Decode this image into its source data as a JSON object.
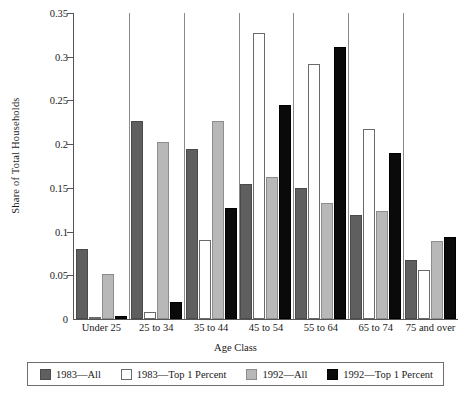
{
  "chart_data": {
    "type": "bar",
    "title": "",
    "xlabel": "Age Class",
    "ylabel": "Share of Total Households",
    "ylim": [
      0,
      0.35
    ],
    "ytick_labels": [
      "0",
      "0.05",
      "0.1",
      "0.15",
      "0.2",
      "0.25",
      "0.3",
      "0.35"
    ],
    "ytick_values": [
      0,
      0.05,
      0.1,
      0.15,
      0.2,
      0.25,
      0.3,
      0.35
    ],
    "grid": false,
    "legend_position": "bottom",
    "categories": [
      "Under 25",
      "25 to 34",
      "35 to 44",
      "45 to 54",
      "55 to 64",
      "65 to 74",
      "75 and over"
    ],
    "series": [
      {
        "name": "1983—All",
        "color": "#5f5f5f",
        "values": [
          0.08,
          0.226,
          0.195,
          0.155,
          0.15,
          0.119,
          0.068
        ]
      },
      {
        "name": "1983—Top 1 Percent",
        "color": "#ffffff",
        "values": [
          0.001,
          0.008,
          0.09,
          0.327,
          0.292,
          0.217,
          0.056
        ]
      },
      {
        "name": "1992—All",
        "color": "#b8b8b8",
        "values": [
          0.052,
          0.203,
          0.226,
          0.162,
          0.133,
          0.124,
          0.089
        ]
      },
      {
        "name": "1992—Top 1 Percent",
        "color": "#0a0a0a",
        "values": [
          0.003,
          0.02,
          0.127,
          0.245,
          0.311,
          0.19,
          0.094
        ]
      }
    ]
  },
  "legend": {
    "items": [
      {
        "label": "1983—All"
      },
      {
        "label": "1983—Top 1 Percent"
      },
      {
        "label": "1992—All"
      },
      {
        "label": "1992—Top 1 Percent"
      }
    ]
  }
}
